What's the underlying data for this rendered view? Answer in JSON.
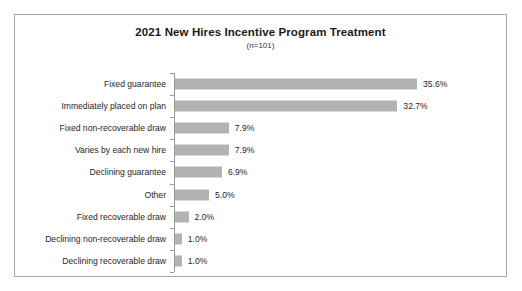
{
  "chart_data": {
    "type": "bar",
    "orientation": "horizontal",
    "title": "2021 New Hires Incentive Program Treatment",
    "subtitle": "(n=101)",
    "xlabel": "",
    "ylabel": "",
    "grid": false,
    "legend": "none",
    "xlim": [
      0,
      40
    ],
    "value_suffix": "%",
    "categories": [
      "Fixed guarantee",
      "Immediately placed on plan",
      "Fixed non-recoverable draw",
      "Varies by each new hire",
      "Declining guarantee",
      "Other",
      "Fixed recoverable draw",
      "Declining non-recoverable draw",
      "Declining recoverable draw"
    ],
    "values": [
      35.6,
      32.7,
      7.9,
      7.9,
      6.9,
      5.0,
      2.0,
      1.0,
      1.0
    ],
    "value_labels": [
      "35.6%",
      "32.7%",
      "7.9%",
      "7.9%",
      "6.9%",
      "5.0%",
      "2.0%",
      "1.0%",
      "1.0%"
    ],
    "bar_color": "#b3b3b3",
    "axis_color": "#9a9a9a",
    "text_color": "#1f1f1f",
    "border_color": "#a8a8a8",
    "background_color": "#ffffff"
  }
}
